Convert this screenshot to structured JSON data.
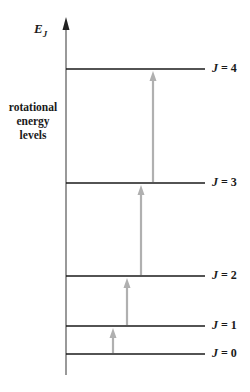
{
  "diagram": {
    "axis": {
      "title_main": "E",
      "title_sub": "J",
      "color": "#555555"
    },
    "side_label": [
      "rotational",
      "energy",
      "levels"
    ],
    "levels": [
      {
        "label_var": "J",
        "label_eq": " = 0",
        "y": 354
      },
      {
        "label_var": "J",
        "label_eq": " = 1",
        "y": 326
      },
      {
        "label_var": "J",
        "label_eq": " = 2",
        "y": 276
      },
      {
        "label_var": "J",
        "label_eq": " = 3",
        "y": 183
      },
      {
        "label_var": "J",
        "label_eq": " = 4",
        "y": 69
      }
    ],
    "transitions": [
      {
        "from": "J = 0",
        "to": "J = 1",
        "x": 113
      },
      {
        "from": "J = 1",
        "to": "J = 2",
        "x": 127
      },
      {
        "from": "J = 2",
        "to": "J = 3",
        "x": 141
      },
      {
        "from": "J = 3",
        "to": "J = 4",
        "x": 153
      }
    ],
    "colors": {
      "level_line": "#1a1a1a",
      "arrow": "#b0b0b0"
    }
  }
}
